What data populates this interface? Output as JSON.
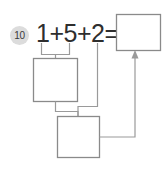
{
  "worksheet": {
    "problem_number": "10",
    "equation": "1+5+2=",
    "operands": [
      "1",
      "5",
      "2"
    ],
    "operators": [
      "+",
      "+"
    ],
    "equals_sign": "=",
    "answer_box_value": "",
    "work_box_1_value": "",
    "work_box_2_value": "",
    "colors": {
      "badge_background": "#dcdcdc",
      "badge_text": "#3a3a3a",
      "equation_text": "#2e2e2e",
      "box_border": "#8a8a8a",
      "connector_line": "#9a9a9a",
      "page_background": "#ffffff"
    },
    "connectors": {
      "bracket_label": "bracket-under-1-and-5",
      "arrow_label": "arrow-into-answer-box"
    }
  }
}
